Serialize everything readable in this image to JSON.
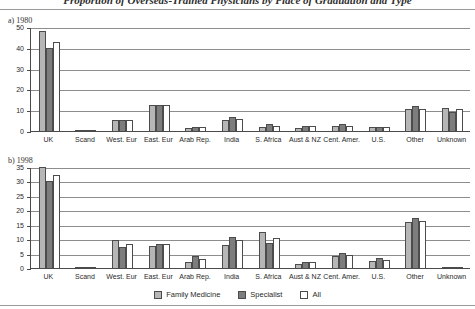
{
  "figure": {
    "title": "Proportion of Overseas-Trained Physicians by Place of Graduation and Type",
    "panel_a_label": "a) 1980",
    "panel_b_label": "b) 1998"
  },
  "legend": {
    "items": [
      {
        "label": "Family Medicine",
        "key": "fam",
        "color": "#b6b6b6"
      },
      {
        "label": "Specialist",
        "key": "spec",
        "color": "#7d7d7d"
      },
      {
        "label": "All",
        "key": "all",
        "color": "#ffffff"
      }
    ]
  },
  "chart_data": [
    {
      "type": "bar",
      "title": "a) 1980",
      "xlabel": "",
      "ylabel": "",
      "ylim": [
        0,
        50
      ],
      "yticks": [
        0,
        10,
        20,
        30,
        40,
        50
      ],
      "ytick_labels": [
        "0",
        "10",
        "20",
        "30",
        "40",
        "50"
      ],
      "grid": true,
      "legend_position": "bottom",
      "categories": [
        "UK",
        "Scand",
        "West. Eur",
        "East. Eur",
        "Arab Rep.",
        "India",
        "S. Africa",
        "Aust & NZ",
        "Cent. Amer.",
        "U.S.",
        "Other",
        "Unknown"
      ],
      "series": [
        {
          "name": "Family Medicine",
          "values": [
            48.0,
            0.4,
            5.2,
            12.4,
            1.3,
            5.4,
            2.0,
            1.5,
            2.5,
            1.8,
            10.5,
            11.0
          ]
        },
        {
          "name": "Specialist",
          "values": [
            40.0,
            0.4,
            5.3,
            12.4,
            2.0,
            6.8,
            3.2,
            2.2,
            3.3,
            2.0,
            12.2,
            9.3
          ]
        },
        {
          "name": "All",
          "values": [
            42.8,
            0.4,
            5.3,
            12.3,
            2.1,
            5.8,
            2.3,
            2.4,
            2.6,
            2.0,
            10.6,
            10.4
          ]
        }
      ]
    },
    {
      "type": "bar",
      "title": "b) 1998",
      "xlabel": "",
      "ylabel": "",
      "ylim": [
        0,
        35
      ],
      "yticks": [
        0,
        5,
        10,
        15,
        20,
        25,
        30,
        35
      ],
      "ytick_labels": [
        "0",
        "5",
        "10",
        "15",
        "20",
        "25",
        "30",
        "35"
      ],
      "grid": true,
      "legend_position": "bottom",
      "categories": [
        "UK",
        "Scand",
        "West. Eur",
        "East. Eur",
        "Arab Rep.",
        "India",
        "S. Africa",
        "Aust & NZ",
        "Cent. Amer.",
        "U.S.",
        "Other",
        "Unknown"
      ],
      "series": [
        {
          "name": "Family Medicine",
          "values": [
            35.0,
            0.3,
            9.6,
            7.8,
            2.2,
            7.9,
            12.6,
            1.5,
            4.0,
            2.6,
            15.8,
            0.0
          ]
        },
        {
          "name": "Specialist",
          "values": [
            30.0,
            0.3,
            7.2,
            8.2,
            4.3,
            10.7,
            8.6,
            2.1,
            5.3,
            3.3,
            17.3,
            0.0
          ]
        },
        {
          "name": "All",
          "values": [
            32.4,
            0.3,
            8.4,
            8.4,
            3.1,
            9.6,
            10.4,
            2.0,
            4.4,
            2.7,
            16.3,
            0.0
          ]
        }
      ]
    }
  ]
}
